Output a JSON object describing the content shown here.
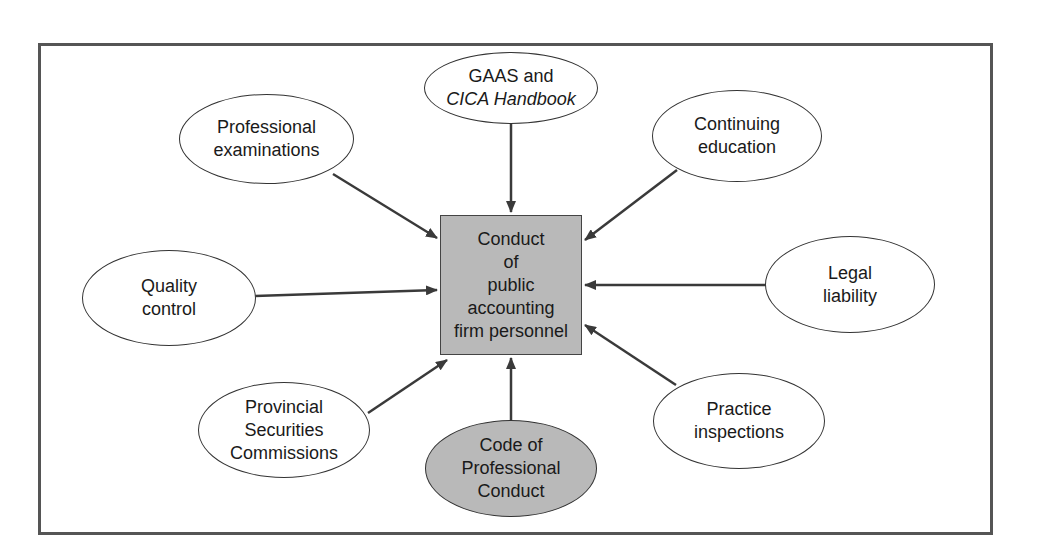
{
  "diagram": {
    "center": {
      "lines": [
        "Conduct",
        "of",
        "public",
        "accounting",
        "firm personnel"
      ],
      "fill": "#b9b9b9"
    },
    "nodes": [
      {
        "id": "gaas",
        "lines": [
          "GAAS and",
          "CICA Handbook"
        ],
        "italic_line": 1,
        "shaded": false
      },
      {
        "id": "professional-examinations",
        "lines": [
          "Professional",
          "examinations"
        ],
        "shaded": false
      },
      {
        "id": "continuing-education",
        "lines": [
          "Continuing",
          "education"
        ],
        "shaded": false
      },
      {
        "id": "quality-control",
        "lines": [
          "Quality",
          "control"
        ],
        "shaded": false
      },
      {
        "id": "legal-liability",
        "lines": [
          "Legal",
          "liability"
        ],
        "shaded": false
      },
      {
        "id": "provincial-securities-commissions",
        "lines": [
          "Provincial",
          "Securities",
          "Commissions"
        ],
        "shaded": false
      },
      {
        "id": "code-of-professional-conduct",
        "lines": [
          "Code of",
          "Professional",
          "Conduct"
        ],
        "shaded": true
      },
      {
        "id": "practice-inspections",
        "lines": [
          "Practice",
          "inspections"
        ],
        "shaded": false
      }
    ],
    "colors": {
      "line": "#3a3a3a",
      "frame": "#555555",
      "shade": "#b9b9b9"
    }
  }
}
